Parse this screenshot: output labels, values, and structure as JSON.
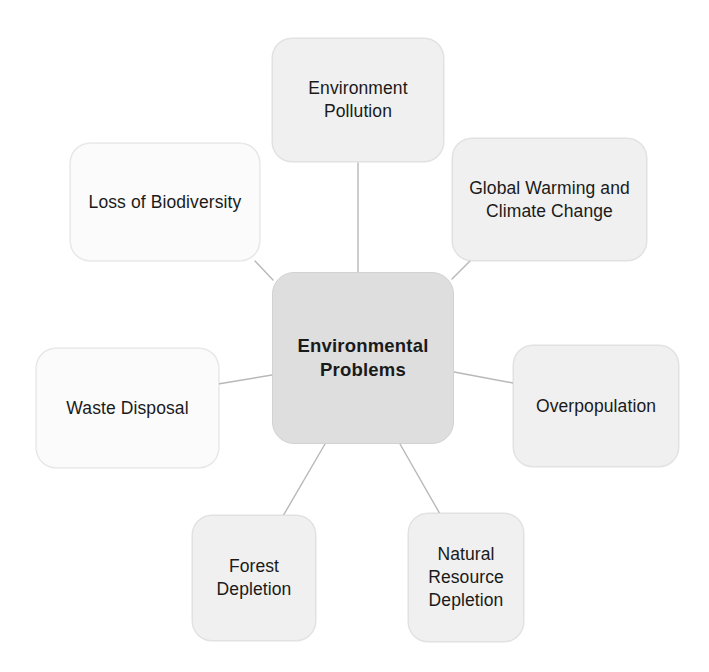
{
  "diagram": {
    "type": "mind-map",
    "title": "Environmental Problems",
    "center": {
      "id": "environmental-problems",
      "label": "Environmental\nProblems",
      "fill": "#dedede",
      "text_color": "#1a1a1a",
      "bold": true
    },
    "nodes": [
      {
        "id": "environment-pollution",
        "label": "Environment\nPollution",
        "position": "top",
        "fill": "#f0f0f0"
      },
      {
        "id": "global-warming",
        "label": "Global Warming and\nClimate Change",
        "position": "top-right",
        "fill": "#f0f0f0"
      },
      {
        "id": "loss-biodiversity",
        "label": "Loss of Biodiversity",
        "position": "top-left",
        "fill": "#fbfbfb"
      },
      {
        "id": "waste-disposal",
        "label": "Waste Disposal",
        "position": "left",
        "fill": "#fbfbfb"
      },
      {
        "id": "overpopulation",
        "label": "Overpopulation",
        "position": "right",
        "fill": "#f0f0f0"
      },
      {
        "id": "forest-depletion",
        "label": "Forest\nDepletion",
        "position": "bottom-left",
        "fill": "#f7f7f7"
      },
      {
        "id": "natural-resource",
        "label": "Natural\nResource\nDepletion",
        "position": "bottom-right",
        "fill": "#f5f5f5"
      }
    ],
    "connectors": [
      {
        "from": "environmental-problems",
        "to": "environment-pollution"
      },
      {
        "from": "environmental-problems",
        "to": "global-warming"
      },
      {
        "from": "environmental-problems",
        "to": "loss-biodiversity"
      },
      {
        "from": "environmental-problems",
        "to": "waste-disposal"
      },
      {
        "from": "environmental-problems",
        "to": "overpopulation"
      },
      {
        "from": "environmental-problems",
        "to": "forest-depletion"
      },
      {
        "from": "environmental-problems",
        "to": "natural-resource"
      }
    ],
    "connector_color": "#b8b8b8"
  }
}
